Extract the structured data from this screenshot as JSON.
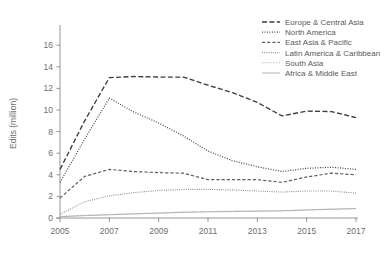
{
  "chart_data": {
    "type": "line",
    "title": "",
    "subtitle": "",
    "xlabel": "",
    "ylabel": "Edits (million)",
    "xlim": [
      2005,
      2017
    ],
    "ylim": [
      0,
      17.5
    ],
    "yticks": [
      0,
      2,
      4,
      6,
      8,
      10,
      12,
      14,
      16
    ],
    "xticks": [
      2005,
      2007,
      2009,
      2011,
      2013,
      2015,
      2017
    ],
    "xtick_labels": [
      "2005",
      "2007",
      "2009",
      "2011",
      "2013",
      "2015",
      "2017"
    ],
    "ytick_labels": [
      "0",
      "2",
      "4",
      "6",
      "8",
      "10",
      "12",
      "14",
      "16"
    ],
    "grid": false,
    "legend_position": "top-right",
    "x": [
      2005,
      2006,
      2007,
      2008,
      2009,
      2010,
      2011,
      2012,
      2013,
      2014,
      2015,
      2016,
      2017
    ],
    "series": [
      {
        "name": "Europe & Central Asia",
        "values": [
          4.5,
          9.0,
          13.0,
          13.1,
          13.05,
          13.05,
          12.3,
          11.6,
          10.7,
          9.45,
          9.9,
          9.85,
          9.3
        ],
        "color": "#3d3d3d",
        "dash": "5,2.4",
        "width": 1.35
      },
      {
        "name": "North America",
        "values": [
          3.3,
          7.3,
          11.1,
          9.8,
          8.8,
          7.6,
          6.2,
          5.3,
          4.75,
          4.3,
          4.6,
          4.7,
          4.5
        ],
        "color": "#4a4a4a",
        "dash": "1,1.5",
        "width": 1.25
      },
      {
        "name": "East Asia & Pacific",
        "values": [
          1.85,
          3.85,
          4.5,
          4.3,
          4.2,
          4.15,
          3.55,
          3.55,
          3.55,
          3.3,
          3.8,
          4.15,
          4.0
        ],
        "color": "#5e5e5e",
        "dash": "3.2,2",
        "width": 1.2
      },
      {
        "name": "Latin America & Caribbean",
        "values": [
          0.35,
          1.5,
          2.05,
          2.35,
          2.55,
          2.65,
          2.65,
          2.6,
          2.5,
          2.4,
          2.5,
          2.5,
          2.3
        ],
        "color": "#848484",
        "dash": "0.9,1.3",
        "width": 1.15
      },
      {
        "name": "South Asia",
        "values": [
          0.15,
          0.25,
          0.32,
          0.4,
          0.47,
          0.55,
          0.6,
          0.63,
          0.66,
          0.68,
          0.76,
          0.83,
          0.88
        ],
        "color": "#bcbcbc",
        "dash": "1.4,1.4",
        "width": 1.1
      },
      {
        "name": "Africa & Middle East",
        "values": [
          0.12,
          0.22,
          0.3,
          0.38,
          0.45,
          0.52,
          0.57,
          0.6,
          0.63,
          0.66,
          0.74,
          0.81,
          0.87
        ],
        "color": "#b2b2b2",
        "dash": "none",
        "width": 1.0
      }
    ]
  },
  "legend": {
    "items": [
      {
        "label": "Europe & Central Asia"
      },
      {
        "label": "North America"
      },
      {
        "label": "East Asia & Pacific"
      },
      {
        "label": "Latin America & Caribbean"
      },
      {
        "label": "South Asia"
      },
      {
        "label": "Africa & Middle East"
      }
    ]
  }
}
